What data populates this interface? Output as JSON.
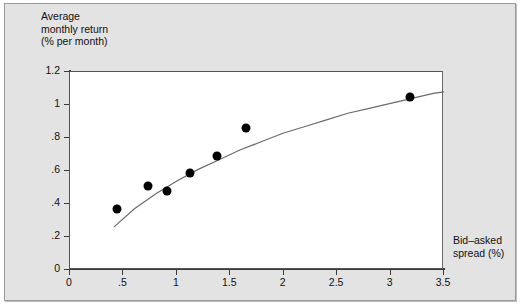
{
  "chart_data": {
    "type": "scatter",
    "title": "",
    "xlabel": "Bid–asked\nspread (%)",
    "ylabel": "Average\nmonthly return\n(% per month)",
    "xlim": [
      0,
      3.5
    ],
    "ylim": [
      0,
      1.2
    ],
    "grid": false,
    "legend": "none",
    "xticks": [
      "0",
      ".5",
      "1",
      "1.5",
      "2",
      "2.5",
      "3",
      "3.5"
    ],
    "xtick_values": [
      0,
      0.5,
      1,
      1.5,
      2,
      2.5,
      3,
      3.5
    ],
    "yticks": [
      "0",
      ".2",
      ".4",
      ".6",
      ".8",
      "1",
      "1.2"
    ],
    "ytick_values": [
      0,
      0.2,
      0.4,
      0.6,
      0.8,
      1.0,
      1.2
    ],
    "points": [
      {
        "x": 0.44,
        "y": 0.37
      },
      {
        "x": 0.73,
        "y": 0.51
      },
      {
        "x": 0.91,
        "y": 0.48
      },
      {
        "x": 1.12,
        "y": 0.59
      },
      {
        "x": 1.38,
        "y": 0.69
      },
      {
        "x": 1.65,
        "y": 0.86
      },
      {
        "x": 3.18,
        "y": 1.05
      }
    ],
    "fit_curve": {
      "name": "fitted concave curve",
      "color": "#6b6b6b",
      "x": [
        0.41,
        0.6,
        0.8,
        1.0,
        1.2,
        1.4,
        1.6,
        1.8,
        2.0,
        2.2,
        2.4,
        2.6,
        2.8,
        3.0,
        3.2,
        3.4,
        3.5
      ],
      "y": [
        0.26,
        0.37,
        0.46,
        0.54,
        0.61,
        0.67,
        0.73,
        0.78,
        0.83,
        0.87,
        0.91,
        0.95,
        0.98,
        1.01,
        1.04,
        1.07,
        1.08
      ]
    },
    "marker_color": "#000000",
    "plot_background": "#ffffff",
    "figure_background": "#e3e3e3"
  }
}
